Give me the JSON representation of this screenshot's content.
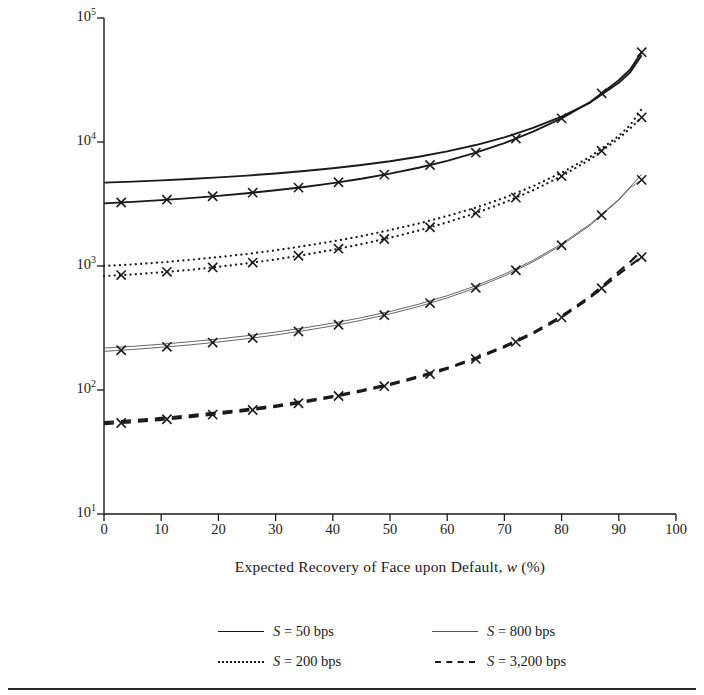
{
  "chart_data": {
    "type": "line",
    "title": "",
    "xlabel": "Expected Recovery of Face upon Default, w (%)",
    "ylabel": "Mean Intensity, h̄ (bps)",
    "xlabel_parts": {
      "pre": "Expected Recovery of Face upon Default, ",
      "var": "w",
      "post": " (%)"
    },
    "ylabel_parts": {
      "pre": "Mean Intensity, ",
      "var": "h",
      "post": " (bps)"
    },
    "xlim": [
      0,
      100
    ],
    "ylim": [
      10,
      100000
    ],
    "yscale": "log",
    "xscale": "linear",
    "grid": false,
    "xticks": [
      0,
      10,
      20,
      30,
      40,
      50,
      60,
      70,
      80,
      90,
      100
    ],
    "xtick_labels": [
      "0",
      "10",
      "20",
      "30",
      "40",
      "50",
      "60",
      "70",
      "80",
      "90",
      "100"
    ],
    "yticks": [
      10,
      100,
      1000,
      10000,
      100000
    ],
    "ytick_labels": [
      "10¹",
      "10²",
      "10³",
      "10⁴",
      "10⁵"
    ],
    "ytick_mantissa": [
      "10",
      "10",
      "10",
      "10",
      "10"
    ],
    "ytick_exponent": [
      "1",
      "2",
      "3",
      "4",
      "5"
    ],
    "legend_position": "below-center",
    "marker": "x",
    "series": [
      {
        "name": "S = 50 bps",
        "legend_label": "S = 50 bps",
        "legend_var": "S",
        "legend_rest": " = 50 bps",
        "style": "solid-thick",
        "color": "#1a1a1a",
        "width": 1.9,
        "pair": [
          {
            "role": "upper",
            "markers": false,
            "x": [
              0,
              5,
              10,
              15,
              20,
              25,
              30,
              35,
              40,
              45,
              50,
              55,
              60,
              65,
              70,
              75,
              80,
              85,
              90,
              92,
              94
            ],
            "y": [
              4700,
              4790,
              4900,
              5030,
              5180,
              5360,
              5570,
              5830,
              6150,
              6530,
              7000,
              7600,
              8400,
              9450,
              10900,
              13000,
              16000,
              20800,
              30000,
              36500,
              50000
            ]
          },
          {
            "role": "lower",
            "markers": true,
            "marker_x": [
              3,
              11,
              19,
              26,
              34,
              41,
              49,
              57,
              65,
              72,
              80,
              87,
              94
            ],
            "x": [
              0,
              5,
              10,
              15,
              20,
              25,
              30,
              35,
              40,
              45,
              50,
              55,
              60,
              65,
              70,
              75,
              80,
              85,
              90,
              92,
              94
            ],
            "y": [
              3200,
              3290,
              3400,
              3530,
              3680,
              3860,
              4080,
              4340,
              4660,
              5060,
              5560,
              6200,
              7050,
              8200,
              9800,
              12100,
              15500,
              21000,
              31500,
              38500,
              53000
            ]
          }
        ]
      },
      {
        "name": "S = 200 bps",
        "legend_label": "S = 200 bps",
        "legend_var": "S",
        "legend_rest": " = 200 bps",
        "style": "dotted",
        "color": "#1a1a1a",
        "width": 2.2,
        "pair": [
          {
            "role": "upper",
            "markers": false,
            "x": [
              0,
              5,
              10,
              15,
              20,
              25,
              30,
              35,
              40,
              45,
              50,
              55,
              60,
              65,
              70,
              75,
              80,
              85,
              90,
              92,
              94
            ],
            "y": [
              1000,
              1030,
              1070,
              1120,
              1180,
              1250,
              1340,
              1450,
              1580,
              1740,
              1950,
              2200,
              2530,
              2950,
              3550,
              4400,
              5650,
              7600,
              11200,
              13700,
              18500
            ]
          },
          {
            "role": "lower",
            "markers": true,
            "marker_x": [
              3,
              11,
              19,
              26,
              34,
              41,
              49,
              57,
              65,
              72,
              80,
              87,
              94
            ],
            "x": [
              0,
              5,
              10,
              15,
              20,
              25,
              30,
              35,
              40,
              45,
              50,
              55,
              60,
              65,
              70,
              75,
              80,
              85,
              90,
              92,
              94
            ],
            "y": [
              830,
              855,
              890,
              930,
              985,
              1050,
              1130,
              1230,
              1350,
              1500,
              1690,
              1930,
              2250,
              2670,
              3250,
              4080,
              5300,
              7250,
              10700,
              12900,
              15800
            ]
          }
        ]
      },
      {
        "name": "S = 800 bps",
        "legend_label": "S = 800 bps",
        "legend_var": "S",
        "legend_rest": " = 800 bps",
        "style": "solid-thin",
        "color": "#555555",
        "width": 0.9,
        "pair": [
          {
            "role": "upper",
            "markers": false,
            "x": [
              0,
              5,
              10,
              15,
              20,
              25,
              30,
              35,
              40,
              45,
              50,
              55,
              60,
              65,
              70,
              75,
              80,
              85,
              90,
              92,
              94
            ],
            "y": [
              218,
              225,
              234,
              245,
              258,
              274,
              293,
              317,
              346,
              383,
              430,
              492,
              576,
              692,
              860,
              1110,
              1510,
              2180,
              3450,
              4350,
              5500
            ]
          },
          {
            "role": "lower",
            "markers": true,
            "marker_x": [
              3,
              11,
              19,
              26,
              34,
              41,
              49,
              57,
              65,
              72,
              80,
              87,
              94
            ],
            "x": [
              0,
              5,
              10,
              15,
              20,
              25,
              30,
              35,
              40,
              45,
              50,
              55,
              60,
              65,
              70,
              75,
              80,
              85,
              90,
              92,
              94
            ],
            "y": [
              205,
              212,
              221,
              231,
              244,
              259,
              278,
              301,
              329,
              365,
              411,
              471,
              553,
              667,
              832,
              1080,
              1470,
              2130,
              3400,
              4280,
              4950
            ]
          }
        ]
      },
      {
        "name": "S = 3,200 bps",
        "legend_label": "S = 3,200 bps",
        "legend_var": "S",
        "legend_rest": " = 3,200 bps",
        "style": "dashed",
        "color": "#1a1a1a",
        "width": 2.2,
        "pair": [
          {
            "role": "upper",
            "markers": false,
            "x": [
              0,
              5,
              10,
              15,
              20,
              25,
              30,
              35,
              40,
              45,
              50,
              55,
              60,
              65,
              70,
              75,
              80,
              85,
              90,
              92,
              94
            ],
            "y": [
              55,
              57,
              59.5,
              62.5,
              66,
              70,
              75,
              81.5,
              89.5,
              99.5,
              112,
              129,
              151,
              182,
              226,
              291,
              395,
              570,
              900,
              1080,
              1330
            ]
          },
          {
            "role": "lower",
            "markers": true,
            "marker_x": [
              3,
              11,
              19,
              26,
              34,
              41,
              49,
              57,
              65,
              72,
              80,
              87,
              94
            ],
            "x": [
              0,
              5,
              10,
              15,
              20,
              25,
              30,
              35,
              40,
              45,
              50,
              55,
              60,
              65,
              70,
              75,
              80,
              85,
              90,
              92,
              94
            ],
            "y": [
              53,
              55,
              57.5,
              60.5,
              64,
              68,
              73,
              79.5,
              87.5,
              97.5,
              110,
              126,
              148,
              178,
              221,
              284,
              385,
              555,
              860,
              1010,
              1180
            ]
          }
        ]
      }
    ]
  },
  "legend": {
    "items": [
      {
        "label": "S = 50 bps",
        "var": "S",
        "rest": " = 50 bps",
        "style": "solid-thick",
        "col": 0,
        "row": 0
      },
      {
        "label": "S = 800 bps",
        "var": "S",
        "rest": " = 800 bps",
        "style": "solid-thin",
        "col": 1,
        "row": 0
      },
      {
        "label": "S = 200 bps",
        "var": "S",
        "rest": " = 200 bps",
        "style": "dotted",
        "col": 0,
        "row": 1
      },
      {
        "label": "S = 3,200 bps",
        "var": "S",
        "rest": " = 3,200 bps",
        "style": "dashed",
        "col": 1,
        "row": 1
      }
    ]
  },
  "colors": {
    "axis": "#1a1a1a",
    "text": "#1a1a1a",
    "thin_line": "#555555",
    "background": "#ffffff",
    "rule": "#2a2a2a"
  }
}
